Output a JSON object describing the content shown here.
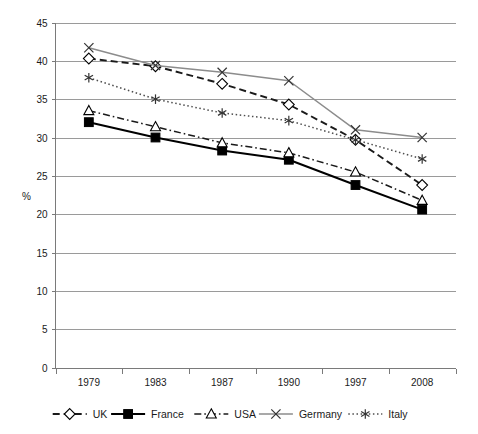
{
  "chart_data": {
    "type": "line",
    "title": "",
    "subtitle": "",
    "xlabel": "",
    "ylabel": "%",
    "categories": [
      "1979",
      "1983",
      "1987",
      "1990",
      "1997",
      "2008"
    ],
    "ylim": [
      0,
      45
    ],
    "ytick_step": 5,
    "yticks": [
      "0",
      "5",
      "10",
      "15",
      "20",
      "25",
      "30",
      "35",
      "40",
      "45"
    ],
    "grid": true,
    "legend_position": "bottom",
    "series": [
      {
        "name": "UK",
        "values": [
          40.3,
          39.3,
          37.0,
          34.3,
          29.7,
          23.8
        ],
        "marker": "open-diamond",
        "line_style": "dashed",
        "color": "#1a1a1a"
      },
      {
        "name": "France",
        "values": [
          32.0,
          30.0,
          28.3,
          27.1,
          23.8,
          20.6
        ],
        "marker": "filled-square",
        "line_style": "solid",
        "color": "#000000"
      },
      {
        "name": "USA",
        "values": [
          33.5,
          31.4,
          29.3,
          28.0,
          25.5,
          21.8
        ],
        "marker": "open-triangle",
        "line_style": "dash-dot",
        "color": "#1a1a1a"
      },
      {
        "name": "Germany",
        "values": [
          41.7,
          39.4,
          38.5,
          37.4,
          31.0,
          30.0
        ],
        "marker": "cross-x",
        "line_style": "solid",
        "color": "#8c8c8c"
      },
      {
        "name": "Italy",
        "values": [
          37.8,
          35.0,
          33.2,
          32.2,
          29.7,
          27.2
        ],
        "marker": "asterisk",
        "line_style": "dotted",
        "color": "#4d4d4d"
      }
    ]
  },
  "legend": {
    "items": [
      {
        "label": "UK"
      },
      {
        "label": "France"
      },
      {
        "label": "USA"
      },
      {
        "label": "Germany"
      },
      {
        "label": "Italy"
      }
    ]
  }
}
